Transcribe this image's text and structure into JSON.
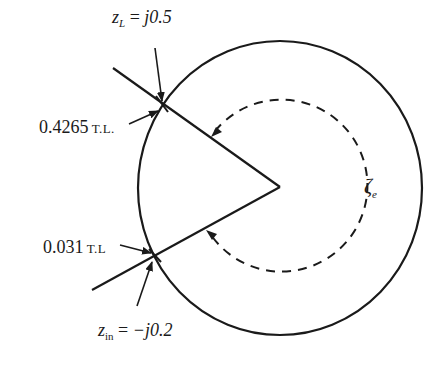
{
  "diagram": {
    "type": "smith-chart-construction",
    "colors": {
      "ink": "#1a1a1a",
      "background": "#ffffff"
    },
    "outer_circle": {
      "label": ""
    },
    "dashed_arc": {
      "label_symbol": "ζ",
      "label_sub": "e"
    },
    "labels": {
      "load": {
        "var": "z",
        "sub": "L",
        "eq": " = ",
        "value": "j0.5"
      },
      "load_position": {
        "value": "0.4265",
        "unit": " T.L."
      },
      "input_position": {
        "value": "0.031",
        "unit": " T.L"
      },
      "input": {
        "var": "z",
        "sub": "in",
        "eq": " = ",
        "value": "−j0.2"
      }
    }
  }
}
